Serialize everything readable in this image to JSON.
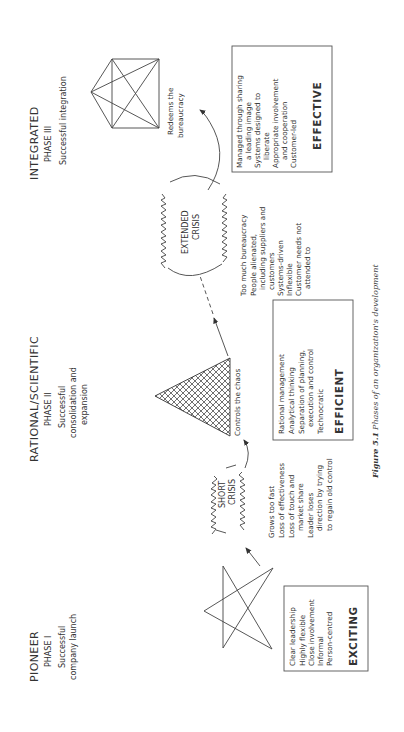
{
  "phases": [
    {
      "name": "PIONEER",
      "phase": "PHASE I",
      "subtitle": [
        "Successful",
        "company launch"
      ],
      "shape": "pentagram-star",
      "box_lines": [
        "Clear leadership",
        "Highly flexible",
        "Close involvement",
        "Informal",
        "Person-centred"
      ],
      "box_label": "EXCITING"
    },
    {
      "name": "RATIONAL/SCIENTIFIC",
      "phase": "PHASE II",
      "subtitle": [
        "Successful",
        "consolidation and",
        "expansion"
      ],
      "shape": "hatched-triangle",
      "shape_caption": "Controls the chaos",
      "box_lines": [
        "Rational management",
        "Analytical thinking",
        "Separation of planning,",
        "execution and control",
        "Technocratic"
      ],
      "box_label": "EFFICIENT"
    },
    {
      "name": "INTEGRATED",
      "phase": "PHASE III",
      "subtitle": [
        "Successful integration"
      ],
      "shape": "connected-pentagon",
      "shape_caption": [
        "Redeems the",
        "bureaucracy"
      ],
      "box_lines": [
        "Managed through sharing",
        "a leading image",
        "Systems designed to",
        "liberate",
        "Appropriate involvement",
        "and cooperation",
        "Customer-led"
      ],
      "box_label": "EFFECTIVE"
    }
  ],
  "crises": [
    {
      "label": [
        "SHORT",
        "CRISIS"
      ],
      "symptoms": [
        "Grows too fast",
        "Loss of effectiveness",
        "Loss of touch and",
        "market share",
        "Leader loses",
        "direction by trying",
        "to regain old control"
      ]
    },
    {
      "label": [
        "EXTENDED",
        "CRISIS"
      ],
      "symptoms": [
        "Too much bureaucracy",
        "People alienated,",
        "including suppliers and",
        "customers",
        "Systems-driven",
        "Inflexible",
        "Customer needs not",
        "attended to"
      ]
    }
  ],
  "caption": {
    "figure": "Figure 5.1",
    "text": "Phases of an organization's development"
  }
}
